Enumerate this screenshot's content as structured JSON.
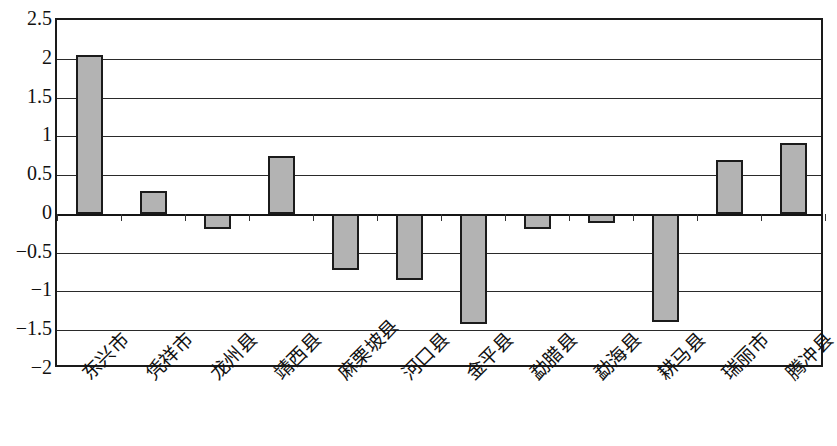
{
  "chart_data": {
    "type": "bar",
    "title": "",
    "subtitle": "",
    "xlabel": "",
    "ylabel": "",
    "ylim": [
      -2,
      2.5
    ],
    "ytick_values": [
      2.5,
      2,
      1.5,
      1,
      0.5,
      0,
      -0.5,
      -1,
      -1.5,
      -2
    ],
    "ytick_labels": [
      "2.5",
      "2",
      "1.5",
      "1",
      "0.5",
      "0",
      "−0.5",
      "−1",
      "−1.5",
      "−2"
    ],
    "grid": true,
    "grid_axis": "y",
    "legend": null,
    "legend_position": "none",
    "bar_fill_color": "#b3b3b3",
    "bar_edge_color": "#1b1b1b",
    "axis_color": "#1a1a1a",
    "categories": [
      "东兴市",
      "凭祥市",
      "龙州县",
      "靖西县",
      "麻栗坡县",
      "河口县",
      "金平县",
      "勐腊县",
      "勐海县",
      "耕马县",
      "瑞丽市",
      "腾冲县"
    ],
    "values": [
      2.05,
      0.3,
      -0.19,
      0.75,
      -0.72,
      -0.85,
      -1.42,
      -0.19,
      -0.12,
      -1.4,
      0.7,
      0.92
    ]
  }
}
